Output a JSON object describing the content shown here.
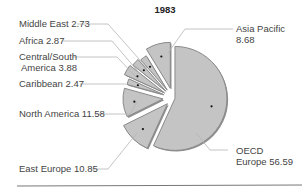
{
  "chart_data": {
    "type": "pie",
    "title": "1983",
    "exploded": true,
    "slices": [
      {
        "label": "OECD Europe",
        "value": 56.59
      },
      {
        "label": "East Europe",
        "value": 10.85
      },
      {
        "label": "North America",
        "value": 11.58
      },
      {
        "label": "Caribbean",
        "value": 2.47
      },
      {
        "label": "Central/South America",
        "value": 3.88
      },
      {
        "label": "Africa",
        "value": 2.87
      },
      {
        "label": "Middle East",
        "value": 2.73
      },
      {
        "label": "Asia Pacific",
        "value": 8.68
      }
    ],
    "colors": {
      "fill": "#c4c4c4",
      "edge": "#8a8a8a",
      "leader": "#b0b0b0",
      "text": "#444444"
    }
  },
  "labels": {
    "title": "1983",
    "middle_east": "Middle East 2.73",
    "africa": "Africa 2.87",
    "csa_line1": "Central/South",
    "csa_line2": "America 3.88",
    "caribbean": "Caribbean 2.47",
    "north_america": "North America 11.58",
    "east_europe": "East  Europe 10.85",
    "asia_line1": "Asia Pacific",
    "asia_line2": "8.68",
    "oecd_line1": "OECD",
    "oecd_line2": "Europe 56.59"
  }
}
